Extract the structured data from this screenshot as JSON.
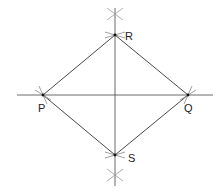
{
  "diagram": {
    "colors": {
      "line": "#333333",
      "arc": "#888888",
      "point": "#111111",
      "background": "#ffffff"
    },
    "points": {
      "P": {
        "label": "P",
        "x": 43,
        "y": 95
      },
      "Q": {
        "label": "Q",
        "x": 188,
        "y": 95
      },
      "R": {
        "label": "R",
        "x": 115,
        "y": 35
      },
      "S": {
        "label": "S",
        "x": 115,
        "y": 155
      }
    },
    "edges": [
      [
        "P",
        "R"
      ],
      [
        "R",
        "Q"
      ],
      [
        "Q",
        "S"
      ],
      [
        "S",
        "P"
      ]
    ],
    "construction_lines": {
      "horizontal": {
        "x1": 17,
        "y1": 95,
        "x2": 213,
        "y2": 95
      },
      "vertical": {
        "x1": 115,
        "y1": 8,
        "x2": 115,
        "y2": 186
      }
    },
    "arc_crossings": [
      {
        "x": 115,
        "y": 14
      },
      {
        "x": 115,
        "y": 175
      }
    ]
  }
}
